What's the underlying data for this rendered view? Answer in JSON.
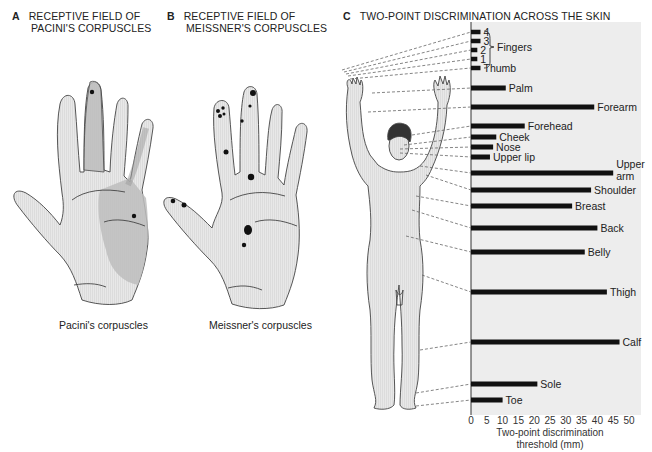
{
  "panels": {
    "a": {
      "letter": "A",
      "title_line1": "RECEPTIVE FIELD OF",
      "title_line2": "PACINI'S CORPUSCLES",
      "caption": "Pacini's corpuscles"
    },
    "b": {
      "letter": "B",
      "title_line1": "RECEPTIVE FIELD OF",
      "title_line2": "MEISSNER'S CORPUSCLES",
      "caption": "Meissner's corpuscles"
    },
    "c": {
      "letter": "C",
      "title": "TWO-POINT DISCRIMINATION ACROSS THE SKIN"
    }
  },
  "colors": {
    "bar": "#111111",
    "chart_bg": "#ececec",
    "hand_fill": "#e6e6e6",
    "field_shade": "#bdbdbd",
    "outline": "#444444"
  },
  "chart_data": {
    "type": "bar",
    "orientation": "horizontal",
    "title": "TWO-POINT DISCRIMINATION ACROSS THE SKIN",
    "xlabel": "Two-point discrimination threshold (mm)",
    "ylabel": "",
    "xlim": [
      0,
      50
    ],
    "xticks": [
      0,
      5,
      10,
      15,
      20,
      25,
      30,
      35,
      40,
      45,
      50
    ],
    "grid": false,
    "group_labels": [
      {
        "label": "Fingers",
        "members": [
          "4",
          "3",
          "2",
          "1"
        ]
      }
    ],
    "categories": [
      "4",
      "3",
      "2",
      "1",
      "Thumb",
      "Palm",
      "Forearm",
      "Forehead",
      "Cheek",
      "Nose",
      "Upper lip",
      "Upper arm",
      "Shoulder",
      "Breast",
      "Back",
      "Belly",
      "Thigh",
      "Calf",
      "Sole",
      "Toe"
    ],
    "values": [
      3,
      3,
      2,
      2,
      3,
      11,
      39,
      17,
      8,
      7,
      6,
      45,
      38,
      32,
      40,
      36,
      43,
      47,
      21,
      10
    ]
  }
}
